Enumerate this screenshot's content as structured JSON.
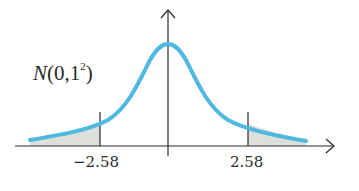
{
  "diagram": {
    "distribution_label": {
      "name": "N",
      "open": "(",
      "mean": "0",
      "sep": ",",
      "sd": "1",
      "power": "2",
      "close": ")"
    },
    "critical_values": {
      "left": "−2.58",
      "right": "2.58"
    },
    "colors": {
      "curve": "#4db8e0",
      "axis": "#2a2a2a",
      "shade": "#d9dbd6"
    }
  }
}
